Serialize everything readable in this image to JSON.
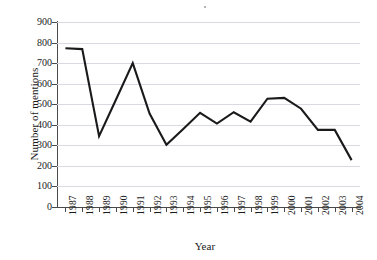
{
  "chart_data": {
    "type": "line",
    "title": "",
    "xlabel": "Year",
    "ylabel": "Number of mentions",
    "categories": [
      "1987",
      "1988",
      "1989",
      "1990",
      "1991",
      "1992",
      "1993",
      "1994",
      "1995",
      "1996",
      "1997",
      "1998",
      "1999",
      "2000",
      "2001",
      "2002",
      "2003",
      "2004"
    ],
    "values": [
      772,
      768,
      345,
      522,
      700,
      455,
      303,
      380,
      458,
      406,
      461,
      415,
      527,
      531,
      478,
      375,
      375,
      228
    ],
    "series": [
      {
        "name": "Number of mentions",
        "values": [
          772,
          768,
          345,
          522,
          700,
          455,
          303,
          380,
          458,
          406,
          461,
          415,
          527,
          531,
          478,
          375,
          375,
          228
        ]
      }
    ],
    "ylim": [
      0,
      900
    ],
    "ytick_values": [
      0,
      100,
      200,
      300,
      400,
      500,
      600,
      700,
      800,
      900
    ],
    "ytick_labels": [
      "0",
      "100",
      "200",
      "300",
      "400",
      "500",
      "600",
      "700",
      "800",
      "900"
    ],
    "xtick_labels": [
      "1987",
      "1988",
      "1989",
      "1990",
      "1991",
      "1992",
      "1993",
      "1994",
      "1995",
      "1996",
      "1997",
      "1998",
      "1999",
      "2000",
      "2001",
      "2002",
      "2003",
      "2004"
    ],
    "grid": true,
    "grid_axis": "y",
    "legend": false,
    "legend_position": "none",
    "line_color": "#1a1a1a",
    "grid_color": "#d9d9e2",
    "axis_color": "#4a4a4a",
    "background_color": "#ffffff",
    "markers": false,
    "xtick_rotation": -90
  }
}
